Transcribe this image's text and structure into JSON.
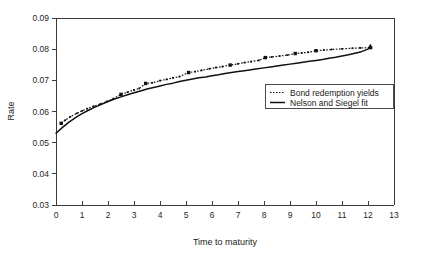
{
  "chart_data": {
    "type": "line",
    "title": "",
    "xlabel": "Time to maturity",
    "ylabel": "Rate",
    "xlim": [
      0,
      13
    ],
    "ylim": [
      0.03,
      0.09
    ],
    "xticks": [
      "0",
      "1",
      "2",
      "3",
      "4",
      "5",
      "6",
      "7",
      "8",
      "9",
      "10",
      "11",
      "12",
      "13"
    ],
    "yticks": [
      "0.03",
      "0.04",
      "0.05",
      "0.06",
      "0.07",
      "0.08",
      "0.09"
    ],
    "grid": false,
    "legend_position": "center-right",
    "series": [
      {
        "name": "Bond redemption yields",
        "style": "dotted",
        "marker": "square",
        "x": [
          0.2,
          0.35,
          0.55,
          0.8,
          1.0,
          1.2,
          1.45,
          1.7,
          1.95,
          2.2,
          2.5,
          2.75,
          3.0,
          3.2,
          3.45,
          3.7,
          4.0,
          4.25,
          4.5,
          4.75,
          5.1,
          5.35,
          5.6,
          5.9,
          6.15,
          6.4,
          6.7,
          7.0,
          7.25,
          7.5,
          7.8,
          8.05,
          8.3,
          8.6,
          8.9,
          9.2,
          9.45,
          9.7,
          10.0,
          10.3,
          10.6,
          11.0,
          11.4,
          11.7,
          12.1
        ],
        "y": [
          0.0562,
          0.0572,
          0.0583,
          0.0594,
          0.0602,
          0.0609,
          0.0617,
          0.0624,
          0.0632,
          0.0641,
          0.0655,
          0.0662,
          0.0669,
          0.0674,
          0.069,
          0.0692,
          0.0699,
          0.0703,
          0.0708,
          0.0712,
          0.0725,
          0.0728,
          0.0732,
          0.0737,
          0.0741,
          0.0744,
          0.0749,
          0.0753,
          0.0757,
          0.076,
          0.0764,
          0.0773,
          0.0775,
          0.0778,
          0.0781,
          0.0786,
          0.0788,
          0.079,
          0.0795,
          0.0797,
          0.0799,
          0.0801,
          0.0803,
          0.0804,
          0.0805
        ]
      },
      {
        "name": "Nelson and Siegel fit",
        "style": "solid",
        "marker": "none",
        "x": [
          0.0,
          0.25,
          0.5,
          0.75,
          1.0,
          1.25,
          1.5,
          1.75,
          2.0,
          2.25,
          2.5,
          2.75,
          3.0,
          3.25,
          3.5,
          3.75,
          4.0,
          4.25,
          4.5,
          4.75,
          5.0,
          5.25,
          5.5,
          5.75,
          6.0,
          6.25,
          6.5,
          6.75,
          7.0,
          7.25,
          7.5,
          7.75,
          8.0,
          8.25,
          8.5,
          8.75,
          9.0,
          9.25,
          9.5,
          9.75,
          10.0,
          10.25,
          10.5,
          10.75,
          11.0,
          11.25,
          11.5,
          11.75,
          12.0,
          12.1
        ],
        "y": [
          0.053,
          0.0549,
          0.0566,
          0.058,
          0.0593,
          0.0604,
          0.0614,
          0.0623,
          0.0632,
          0.064,
          0.0647,
          0.0654,
          0.066,
          0.0666,
          0.0672,
          0.0677,
          0.0682,
          0.0687,
          0.0691,
          0.0696,
          0.07,
          0.0704,
          0.0708,
          0.0711,
          0.0715,
          0.0718,
          0.0722,
          0.0725,
          0.0728,
          0.0731,
          0.0734,
          0.0737,
          0.074,
          0.0743,
          0.0746,
          0.0749,
          0.0752,
          0.0755,
          0.0758,
          0.0761,
          0.0764,
          0.0767,
          0.0771,
          0.0774,
          0.0778,
          0.0782,
          0.0787,
          0.0792,
          0.08,
          0.0814
        ]
      }
    ]
  },
  "legend": {
    "entries": [
      {
        "label": "Bond redemption yields"
      },
      {
        "label": "Nelson and Siegel fit"
      }
    ]
  },
  "colors": {
    "ink": "#111111",
    "frame": "#3a3a3a",
    "background": "#ffffff"
  }
}
